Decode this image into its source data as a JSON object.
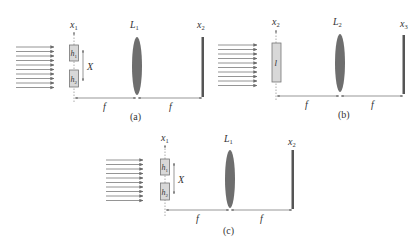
{
  "figure": {
    "panels": [
      {
        "id": "a",
        "caption": "(a)",
        "input_plane_label": "x",
        "input_plane_sub": "1",
        "lens_label": "L",
        "lens_sub": "1",
        "output_plane_label": "x",
        "output_plane_sub": "2",
        "object_type": "double-slit",
        "apertures": [
          {
            "label": "h",
            "sub": "1"
          },
          {
            "label": "h",
            "sub": "2"
          }
        ],
        "separation_label": "X",
        "distance_labels": [
          "f",
          "f"
        ],
        "incident_rays": 10
      },
      {
        "id": "b",
        "caption": "(b)",
        "input_plane_label": "x",
        "input_plane_sub": "2",
        "lens_label": "L",
        "lens_sub": "2",
        "output_plane_label": "x",
        "output_plane_sub": "3",
        "object_type": "single-slit",
        "apertures": [
          {
            "label": "l",
            "sub": ""
          }
        ],
        "distance_labels": [
          "f",
          "f"
        ],
        "incident_rays": 10
      },
      {
        "id": "c",
        "caption": "(c)",
        "input_plane_label": "x",
        "input_plane_sub": "1",
        "lens_label": "L",
        "lens_sub": "1",
        "output_plane_label": "x",
        "output_plane_sub": "2",
        "object_type": "double-slit",
        "apertures": [
          {
            "label": "h",
            "sub": "1"
          },
          {
            "label": "h",
            "sub": "2"
          }
        ],
        "separation_label": "X",
        "distance_labels": [
          "f",
          "f"
        ],
        "incident_rays": 10
      }
    ],
    "colors": {
      "ray": "#7a7a7a",
      "lens": "#6e6e6e",
      "screen": "#555555",
      "aperture_fill": "#d8d8d8",
      "aperture_stroke": "#777777",
      "text": "#333333"
    }
  }
}
